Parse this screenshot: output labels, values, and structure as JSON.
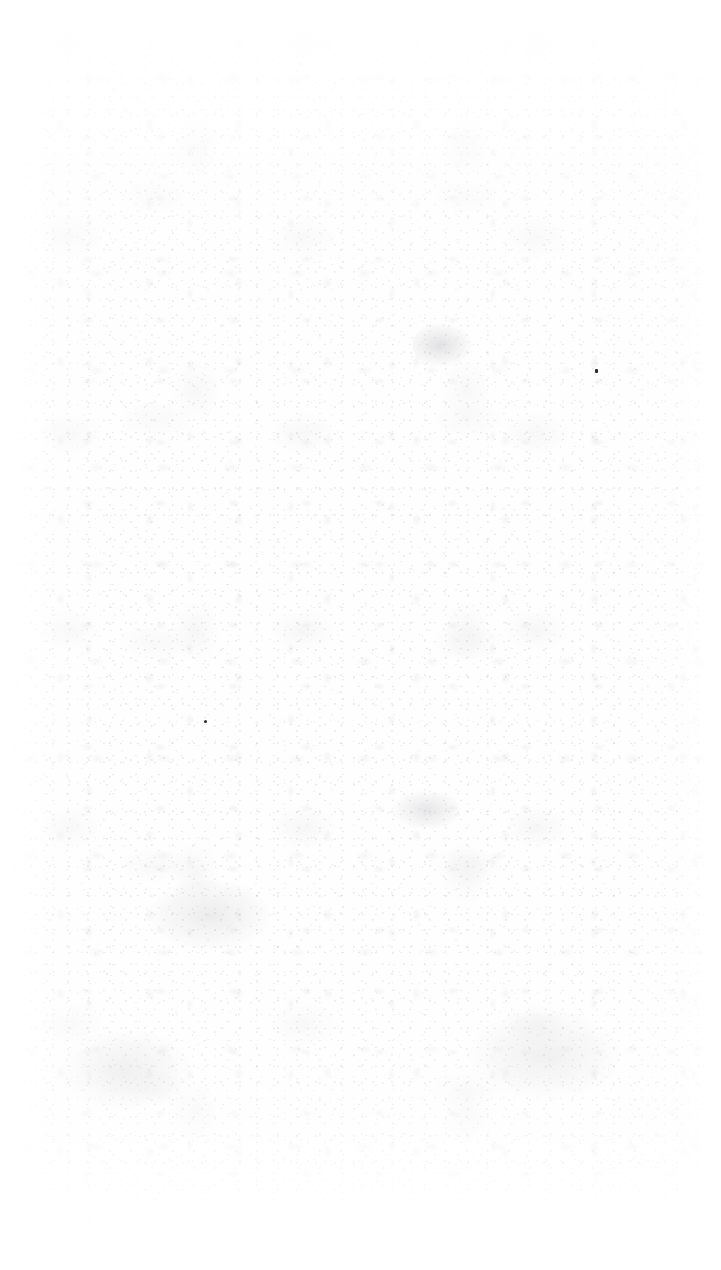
{
  "page": {
    "kind": "blank-scanned-page",
    "orientation": "portrait",
    "width_px": 721,
    "height_px": 1270,
    "text_content": "",
    "visible_text_count": 0,
    "background_color": "#fefefe",
    "grain_color": "#808088",
    "ink_speck_color": "#2b2b2b"
  },
  "texture": {
    "name": "paper-grain",
    "densest_region": "central vertical band",
    "clean_left_margin_px": 40,
    "clean_top_margin_px": 40,
    "clean_bottom_margin_px": 100
  },
  "artifacts": [
    {
      "name": "ink-speck-upper",
      "x": 595,
      "y": 369,
      "width": 3,
      "height": 4
    },
    {
      "name": "ink-speck-lower",
      "x": 204,
      "y": 720,
      "width": 3,
      "height": 3
    }
  ]
}
